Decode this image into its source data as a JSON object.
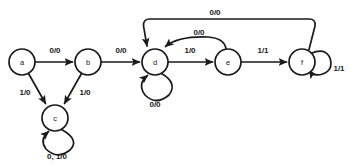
{
  "diagram": {
    "type": "finite-state-machine",
    "node_radius": 13,
    "colors": {
      "stroke": "#1a1a1a",
      "node_fill": "#ffffff",
      "background": "#ffffff"
    },
    "states": [
      {
        "id": "a",
        "label": "a",
        "cx": 22,
        "cy": 62
      },
      {
        "id": "b",
        "label": "b",
        "cx": 88,
        "cy": 62
      },
      {
        "id": "c",
        "label": "c",
        "cx": 55,
        "cy": 118
      },
      {
        "id": "d",
        "label": "d",
        "cx": 155,
        "cy": 62
      },
      {
        "id": "e",
        "label": "e",
        "cx": 228,
        "cy": 62
      },
      {
        "id": "f",
        "label": "f",
        "cx": 302,
        "cy": 62
      }
    ],
    "transitions": [
      {
        "id": "a-b",
        "from": "a",
        "to": "b",
        "label": "0/0",
        "label_x": 55,
        "label_y": 50,
        "kind": "straight"
      },
      {
        "id": "a-c",
        "from": "a",
        "to": "c",
        "label": "1/0",
        "label_x": 25,
        "label_y": 92,
        "kind": "straight"
      },
      {
        "id": "b-d",
        "from": "b",
        "to": "d",
        "label": "0/0",
        "label_x": 121,
        "label_y": 50,
        "kind": "straight"
      },
      {
        "id": "b-c",
        "from": "b",
        "to": "c",
        "label": "1/0",
        "label_x": 85,
        "label_y": 92,
        "kind": "straight"
      },
      {
        "id": "c-c",
        "from": "c",
        "to": "c",
        "label": "0, 1/0",
        "label_x": 57,
        "label_y": 154,
        "kind": "self-loop-below"
      },
      {
        "id": "d-e",
        "from": "d",
        "to": "e",
        "label": "1/0",
        "label_x": 190,
        "label_y": 50,
        "kind": "straight"
      },
      {
        "id": "d-d",
        "from": "d",
        "to": "d",
        "label": "0/0",
        "label_x": 155,
        "label_y": 120,
        "kind": "self-loop-below"
      },
      {
        "id": "e-f",
        "from": "e",
        "to": "f",
        "label": "1/1",
        "label_x": 263,
        "label_y": 50,
        "kind": "straight"
      },
      {
        "id": "e-d",
        "from": "e",
        "to": "d",
        "label": "0/0",
        "label_x": 199,
        "label_y": 32,
        "kind": "arc-above"
      },
      {
        "id": "f-f",
        "from": "f",
        "to": "f",
        "label": "1/1",
        "label_x": 336,
        "label_y": 66,
        "kind": "self-loop-right"
      },
      {
        "id": "f-d",
        "from": "f",
        "to": "d",
        "label": "0/0",
        "label_x": 215,
        "label_y": 12,
        "kind": "arc-above-outer"
      }
    ]
  }
}
